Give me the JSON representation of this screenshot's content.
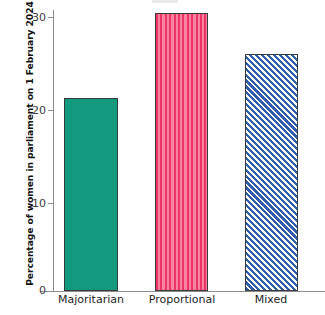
{
  "chart_data": {
    "type": "bar",
    "title": "",
    "xlabel": "",
    "ylabel": "Percentage of women in parliament on 1 February 2024",
    "categories": [
      "Majoritarian",
      "Proportional",
      "Mixed"
    ],
    "values": [
      21.1,
      30.4,
      26.0
    ],
    "ylim": [
      0,
      31
    ],
    "yticks": [
      "0",
      "10",
      "20",
      "30"
    ],
    "ytick_values": [
      0,
      10,
      20,
      30
    ],
    "grid": false,
    "legend": "none",
    "series": [
      {
        "name": "Percentage of women in parliament",
        "values": [
          21.1,
          30.4,
          26.0
        ]
      }
    ],
    "bar_styles": [
      {
        "category": "Majoritarian",
        "fill": "solid",
        "color": "#12997E"
      },
      {
        "category": "Proportional",
        "fill": "vertical-stripes",
        "color": "#EE3366",
        "color_alt": "#F7839E"
      },
      {
        "category": "Mixed",
        "fill": "diagonal-hatch",
        "color": "#2E5FA8",
        "color_alt": "#FFFFFF"
      }
    ],
    "axis_color": "#8D8D8D",
    "bar_edge_color": "#3A3A3A"
  }
}
